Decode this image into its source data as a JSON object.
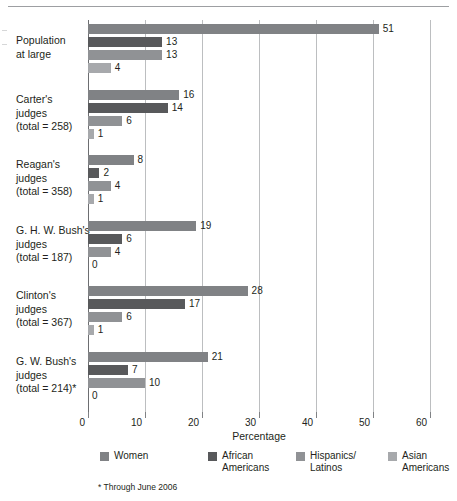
{
  "chart_data": {
    "type": "bar",
    "orientation": "horizontal",
    "title": "",
    "xlabel": "Percentage",
    "ylabel": "",
    "xlim": [
      0,
      60
    ],
    "xticks": [
      0,
      10,
      20,
      30,
      40,
      50,
      60
    ],
    "grid": true,
    "legend_position": "bottom",
    "categories": [
      "Population\nat large",
      "Carter's\njudges\n(total = 258)",
      "Reagan's\njudges\n(total = 358)",
      "G. H. W. Bush's\njudges\n(total = 187)",
      "Clinton's\njudges\n(total = 367)",
      "G. W. Bush's\njudges\n(total = 214)*"
    ],
    "series": [
      {
        "name": "Women",
        "color": "#808285",
        "values": [
          51,
          16,
          8,
          19,
          28,
          21
        ]
      },
      {
        "name": "African\nAmericans",
        "color": "#58595b",
        "values": [
          13,
          14,
          2,
          6,
          17,
          7
        ]
      },
      {
        "name": "Hispanics/\nLatinos",
        "color": "#909295",
        "values": [
          13,
          6,
          4,
          4,
          6,
          10
        ]
      },
      {
        "name": "Asian\nAmericans",
        "color": "#a7a9ac",
        "values": [
          4,
          1,
          1,
          0,
          1,
          0
        ]
      }
    ],
    "annotations": [
      "* Through June 2006"
    ]
  },
  "groups": [
    {
      "label_lines": [
        "Population",
        "at large"
      ],
      "label": "Population at large",
      "bars": [
        {
          "series": "Women",
          "value": 51,
          "value_label": "51",
          "color": "#808285"
        },
        {
          "series": "African Americans",
          "value": 13,
          "value_label": "13",
          "color": "#58595b"
        },
        {
          "series": "Hispanics/Latinos",
          "value": 13,
          "value_label": "13",
          "color": "#909295"
        },
        {
          "series": "Asian Americans",
          "value": 4,
          "value_label": "4",
          "color": "#a7a9ac"
        }
      ]
    },
    {
      "label_lines": [
        "Carter's",
        "judges",
        "(total = 258)"
      ],
      "label": "Carter's judges (total = 258)",
      "bars": [
        {
          "series": "Women",
          "value": 16,
          "value_label": "16",
          "color": "#808285"
        },
        {
          "series": "African Americans",
          "value": 14,
          "value_label": "14",
          "color": "#58595b"
        },
        {
          "series": "Hispanics/Latinos",
          "value": 6,
          "value_label": "6",
          "color": "#909295"
        },
        {
          "series": "Asian Americans",
          "value": 1,
          "value_label": "1",
          "color": "#a7a9ac"
        }
      ]
    },
    {
      "label_lines": [
        "Reagan's",
        "judges",
        "(total = 358)"
      ],
      "label": "Reagan's judges (total = 358)",
      "bars": [
        {
          "series": "Women",
          "value": 8,
          "value_label": "8",
          "color": "#808285"
        },
        {
          "series": "African Americans",
          "value": 2,
          "value_label": "2",
          "color": "#58595b"
        },
        {
          "series": "Hispanics/Latinos",
          "value": 4,
          "value_label": "4",
          "color": "#909295"
        },
        {
          "series": "Asian Americans",
          "value": 1,
          "value_label": "1",
          "color": "#a7a9ac"
        }
      ]
    },
    {
      "label_lines": [
        "G. H. W. Bush's",
        "judges",
        "(total = 187)"
      ],
      "label": "G. H. W. Bush's judges (total = 187)",
      "bars": [
        {
          "series": "Women",
          "value": 19,
          "value_label": "19",
          "color": "#808285"
        },
        {
          "series": "African Americans",
          "value": 6,
          "value_label": "6",
          "color": "#58595b"
        },
        {
          "series": "Hispanics/Latinos",
          "value": 4,
          "value_label": "4",
          "color": "#909295"
        },
        {
          "series": "Asian Americans",
          "value": 0,
          "value_label": "0",
          "color": "#a7a9ac"
        }
      ]
    },
    {
      "label_lines": [
        "Clinton's",
        "judges",
        "(total = 367)"
      ],
      "label": "Clinton's judges (total = 367)",
      "bars": [
        {
          "series": "Women",
          "value": 28,
          "value_label": "28",
          "color": "#808285"
        },
        {
          "series": "African Americans",
          "value": 17,
          "value_label": "17",
          "color": "#58595b"
        },
        {
          "series": "Hispanics/Latinos",
          "value": 6,
          "value_label": "6",
          "color": "#909295"
        },
        {
          "series": "Asian Americans",
          "value": 1,
          "value_label": "1",
          "color": "#a7a9ac"
        }
      ]
    },
    {
      "label_lines": [
        "G. W. Bush's",
        "judges",
        "(total = 214)*"
      ],
      "label": "G. W. Bush's judges (total = 214)*",
      "bars": [
        {
          "series": "Women",
          "value": 21,
          "value_label": "21",
          "color": "#808285"
        },
        {
          "series": "African Americans",
          "value": 7,
          "value_label": "7",
          "color": "#58595b"
        },
        {
          "series": "Hispanics/Latinos",
          "value": 10,
          "value_label": "10",
          "color": "#909295"
        },
        {
          "series": "Asian Americans",
          "value": 0,
          "value_label": "0",
          "color": "#a7a9ac"
        }
      ]
    }
  ],
  "axis": {
    "x_title": "Percentage",
    "tick_labels": [
      "0",
      "10",
      "20",
      "30",
      "40",
      "50",
      "60"
    ]
  },
  "legend": {
    "items": [
      {
        "label": "Women",
        "color": "#808285"
      },
      {
        "label": "African\nAmericans",
        "color": "#58595b"
      },
      {
        "label": "Hispanics/\nLatinos",
        "color": "#909295"
      },
      {
        "label": "Asian\nAmericans",
        "color": "#a7a9ac"
      }
    ]
  },
  "footnote": "* Through June 2006"
}
